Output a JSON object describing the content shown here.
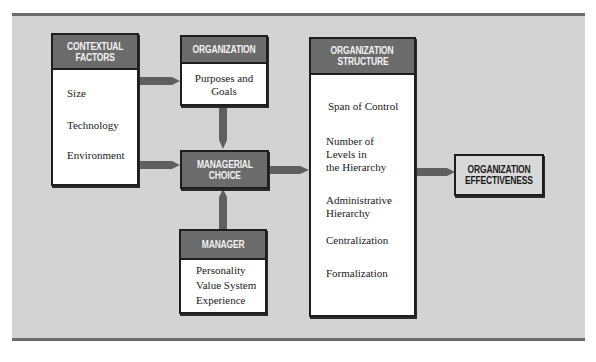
{
  "diagram": {
    "background_color": "#d3d3d3",
    "header_color": "#6b6b6b",
    "arrow_color": "#5f5f5f",
    "nodes": {
      "contextual_factors": {
        "title_line1": "CONTEXTUAL",
        "title_line2": "FACTORS",
        "items": [
          "Size",
          "Technology",
          "Environment"
        ]
      },
      "organization": {
        "title": "ORGANIZATION",
        "body": "Purposes and\nGoals"
      },
      "managerial_choice": {
        "title_line1": "MANAGERIAL",
        "title_line2": "CHOICE"
      },
      "manager": {
        "title": "MANAGER",
        "items": [
          "Personality",
          "Value System",
          "Experience"
        ]
      },
      "organization_structure": {
        "title_line1": "ORGANIZATION",
        "title_line2": "STRUCTURE",
        "items": [
          "Span of Control",
          "Number of\nLevels in\nthe Hierarchy",
          "Administrative\nHierarchy",
          "Centralization",
          "Formalization"
        ]
      },
      "organization_effectiveness": {
        "title_line1": "ORGANIZATION",
        "title_line2": "EFFECTIVENESS"
      }
    },
    "edges": [
      {
        "from": "contextual_factors",
        "to": "organization"
      },
      {
        "from": "contextual_factors",
        "to": "managerial_choice"
      },
      {
        "from": "organization",
        "to": "managerial_choice"
      },
      {
        "from": "manager",
        "to": "managerial_choice"
      },
      {
        "from": "managerial_choice",
        "to": "organization_structure"
      },
      {
        "from": "organization_structure",
        "to": "organization_effectiveness"
      }
    ]
  }
}
